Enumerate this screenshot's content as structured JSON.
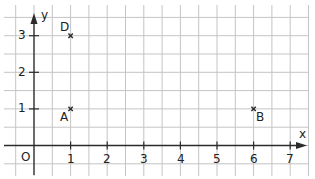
{
  "diagram": {
    "type": "coordinate-grid",
    "colors": {
      "grid": "#c4c4c4",
      "axis": "#2b2b2b",
      "text": "#222222",
      "point": "#2b2b2b"
    },
    "axes": {
      "x_label": "x",
      "y_label": "y",
      "origin_label": "O",
      "x_ticks": [
        "1",
        "2",
        "3",
        "4",
        "5",
        "6",
        "7"
      ],
      "y_ticks": [
        "1",
        "2",
        "3"
      ]
    },
    "points": [
      {
        "name": "A",
        "x": 1,
        "y": 1
      },
      {
        "name": "B",
        "x": 6,
        "y": 1
      },
      {
        "name": "D",
        "x": 1,
        "y": 3
      }
    ]
  }
}
